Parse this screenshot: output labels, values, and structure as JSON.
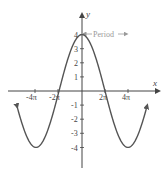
{
  "chart_data": {
    "type": "line",
    "title": "",
    "function": "y = 4 cos(x/4)",
    "xlabel": "x",
    "ylabel": "y",
    "x_ticks": [
      "-4π",
      "-2π",
      "2π",
      "4π"
    ],
    "x_tick_values": [
      -12.566,
      -6.283,
      6.283,
      12.566
    ],
    "y_ticks": [
      "-4",
      "-3",
      "-2",
      "-1",
      "1",
      "2",
      "3",
      "4"
    ],
    "y_tick_values": [
      -4,
      -3,
      -2,
      -1,
      1,
      2,
      3,
      4
    ],
    "xlim": [
      -20,
      20
    ],
    "ylim": [
      -5,
      5
    ],
    "amplitude": 4,
    "period": "8π",
    "annotation": "Period",
    "series": [
      {
        "name": "y = 4cos(x/4)",
        "key_points": [
          {
            "x": "-4π",
            "y": 4
          },
          {
            "x": "-2π",
            "y": -4
          },
          {
            "x": "0",
            "y": 4
          },
          {
            "x": "2π",
            "y": -4
          },
          {
            "x": "4π",
            "y": 4
          }
        ]
      }
    ],
    "grid": false,
    "colors": {
      "curve": "#555555",
      "axis": "#444444",
      "annotation": "#999999"
    }
  },
  "labels": {
    "x_axis": "x",
    "y_axis": "y",
    "period": "Period",
    "x_ticks": {
      "neg4pi": "-4π",
      "neg2pi": "-2π",
      "pos2pi": "2π",
      "pos4pi": "4π"
    },
    "y_ticks": {
      "p4": "4",
      "p3": "3",
      "p2": "2",
      "p1": "1",
      "n1": "-1",
      "n2": "-2",
      "n3": "-3",
      "n4": "-4"
    }
  }
}
